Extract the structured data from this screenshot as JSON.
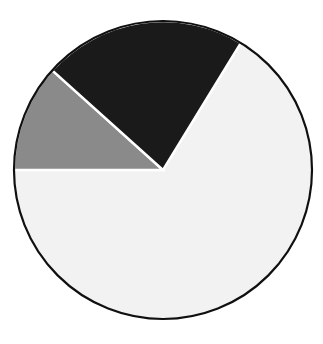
{
  "chart_data": {
    "type": "pie",
    "title": "",
    "subtitle": "",
    "xlabel": "",
    "ylabel": "",
    "legend": false,
    "grid": false,
    "categories": [
      "Light slice",
      "Dark slice",
      "Gray slice"
    ],
    "values": [
      66.3,
      22.1,
      11.6
    ],
    "labels_shown": false,
    "slices": [
      {
        "name": "Light slice",
        "value": 66.3,
        "start_angle_deg": 31.5,
        "end_angle_deg": 270.0,
        "sweep_deg": 238.5,
        "color": "#f2f2f2"
      },
      {
        "name": "Gray slice",
        "value": 11.6,
        "start_angle_deg": 270.0,
        "end_angle_deg": 312.0,
        "sweep_deg": 42.0,
        "color": "#8a8a8a"
      },
      {
        "name": "Dark slice",
        "value": 22.1,
        "start_angle_deg": 312.0,
        "end_angle_deg": 391.5,
        "sweep_deg": 79.5,
        "color": "#1a1a1a"
      }
    ],
    "geometry": {
      "center_x": 163,
      "center_y": 170,
      "radius": 149,
      "start_angle_reference": "12 o'clock, clockwise positive",
      "separator_color": "#ffffff",
      "separator_width": 2.4,
      "outline_color": "#101010",
      "outline_width": 2.2,
      "background": "#ffffff"
    }
  }
}
